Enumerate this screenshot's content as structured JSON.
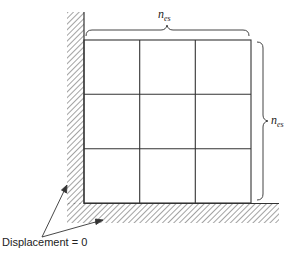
{
  "diagram": {
    "type": "finite-element-mesh",
    "grid": {
      "rows": 3,
      "cols": 3
    },
    "top_dimension": {
      "symbol": "n",
      "subscript": "es"
    },
    "right_dimension": {
      "symbol": "n",
      "subscript": "es"
    },
    "boundary_label": "Displacement = 0",
    "boundaries": [
      "left-wall-fixed",
      "bottom-floor-fixed"
    ],
    "colors": {
      "line": "#333333",
      "hatch": "#555555",
      "background": "#ffffff"
    }
  }
}
